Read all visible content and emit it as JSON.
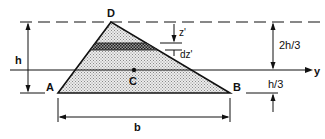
{
  "diagram": {
    "vertices": {
      "apex": "D",
      "bottom_left": "A",
      "bottom_right": "B"
    },
    "centroid_label": "C",
    "axis_label": "y",
    "dimensions": {
      "height": "h",
      "base": "b",
      "top_to_centroid": "2h/3",
      "centroid_to_base": "h/3",
      "strip_depth": "z'",
      "strip_thickness": "dz'"
    },
    "colors": {
      "line": "#111111",
      "fill": "#d8d8d8",
      "strip": "#555555"
    }
  }
}
